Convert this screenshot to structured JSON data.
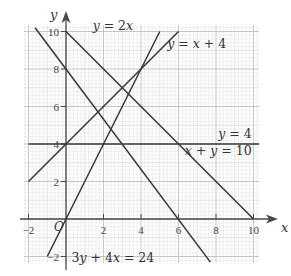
{
  "chart_data": {
    "type": "line",
    "title": "",
    "xlabel": "x",
    "ylabel": "y",
    "xlim": [
      -2,
      10.3
    ],
    "ylim": [
      -2.3,
      10.5
    ],
    "grid": true,
    "x_ticks": [
      -2,
      2,
      4,
      6,
      8,
      10
    ],
    "y_ticks": [
      -2,
      2,
      4,
      6,
      8,
      10
    ],
    "origin_label": "O",
    "series": [
      {
        "name": "y = 2x",
        "points": [
          [
            -1,
            -2
          ],
          [
            5,
            10
          ]
        ]
      },
      {
        "name": "y = x + 4",
        "points": [
          [
            -2,
            2
          ],
          [
            6,
            10
          ]
        ]
      },
      {
        "name": "y = 4",
        "points": [
          [
            -2,
            4
          ],
          [
            10.3,
            4
          ]
        ]
      },
      {
        "name": "x + y = 10",
        "points": [
          [
            0,
            10
          ],
          [
            10,
            0
          ]
        ]
      },
      {
        "name": "3y + 4x = 24",
        "points": [
          [
            -1.65,
            10.2
          ],
          [
            7.7,
            -2.3
          ]
        ]
      }
    ],
    "annotations": [
      {
        "text": "y = 2x",
        "x": 2.5,
        "y": 10.1
      },
      {
        "text": "y = x + 4",
        "x": 5.4,
        "y": 9.1
      },
      {
        "text": "y = 4",
        "x": 9.9,
        "y": 4.3
      },
      {
        "text": "x + y = 10",
        "x": 9.9,
        "y": 3.4
      },
      {
        "text": "3y + 4x = 24",
        "x": 2.5,
        "y": -2.3
      }
    ]
  },
  "colors": {
    "line": "#3a3a3a",
    "axis": "#4a4a4a",
    "grid_minor": "#e6e6e6",
    "grid_unit": "#d0d0d0",
    "grid_major": "#b8b8b8"
  }
}
